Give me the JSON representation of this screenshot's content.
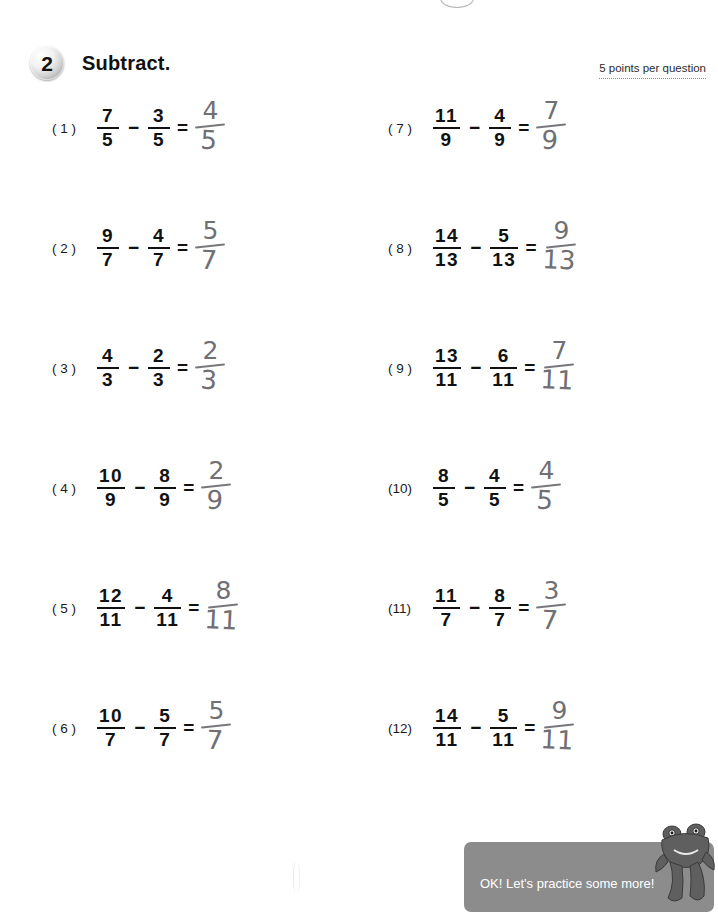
{
  "header": {
    "badge_number": "2",
    "title": "Subtract.",
    "points_note": "5 points per question"
  },
  "problems": [
    {
      "label": "( 1 )",
      "left_num": "7",
      "left_den": "5",
      "op": "−",
      "right_num": "3",
      "right_den": "5",
      "eq": "=",
      "answer_num": "4",
      "answer_den": "5"
    },
    {
      "label": "( 2 )",
      "left_num": "9",
      "left_den": "7",
      "op": "−",
      "right_num": "4",
      "right_den": "7",
      "eq": "=",
      "answer_num": "5",
      "answer_den": "7"
    },
    {
      "label": "( 3 )",
      "left_num": "4",
      "left_den": "3",
      "op": "−",
      "right_num": "2",
      "right_den": "3",
      "eq": "=",
      "answer_num": "2",
      "answer_den": "3"
    },
    {
      "label": "( 4 )",
      "left_num": "10",
      "left_den": "9",
      "op": "−",
      "right_num": "8",
      "right_den": "9",
      "eq": "=",
      "answer_num": "2",
      "answer_den": "9"
    },
    {
      "label": "( 5 )",
      "left_num": "12",
      "left_den": "11",
      "op": "−",
      "right_num": "4",
      "right_den": "11",
      "eq": "=",
      "answer_num": "8",
      "answer_den": "11"
    },
    {
      "label": "( 6 )",
      "left_num": "10",
      "left_den": "7",
      "op": "−",
      "right_num": "5",
      "right_den": "7",
      "eq": "=",
      "answer_num": "5",
      "answer_den": "7"
    },
    {
      "label": "( 7 )",
      "left_num": "11",
      "left_den": "9",
      "op": "−",
      "right_num": "4",
      "right_den": "9",
      "eq": "=",
      "answer_num": "7",
      "answer_den": "9"
    },
    {
      "label": "( 8 )",
      "left_num": "14",
      "left_den": "13",
      "op": "−",
      "right_num": "5",
      "right_den": "13",
      "eq": "=",
      "answer_num": "9",
      "answer_den": "13"
    },
    {
      "label": "( 9 )",
      "left_num": "13",
      "left_den": "11",
      "op": "−",
      "right_num": "6",
      "right_den": "11",
      "eq": "=",
      "answer_num": "7",
      "answer_den": "11"
    },
    {
      "label": "(10)",
      "left_num": "8",
      "left_den": "5",
      "op": "−",
      "right_num": "4",
      "right_den": "5",
      "eq": "=",
      "answer_num": "4",
      "answer_den": "5"
    },
    {
      "label": "(11)",
      "left_num": "11",
      "left_den": "7",
      "op": "−",
      "right_num": "8",
      "right_den": "7",
      "eq": "=",
      "answer_num": "3",
      "answer_den": "7"
    },
    {
      "label": "(12)",
      "left_num": "14",
      "left_den": "11",
      "op": "−",
      "right_num": "5",
      "right_den": "11",
      "eq": "=",
      "answer_num": "9",
      "answer_den": "11"
    }
  ],
  "footer": {
    "message": "OK! Let's practice some more!",
    "banner_color": "#8c8c8c",
    "mascot_icon": "frog-mascot-icon"
  }
}
